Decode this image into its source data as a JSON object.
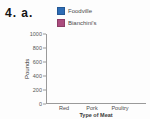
{
  "page": {
    "question_label": "4. a."
  },
  "chart_data": {
    "type": "bar",
    "title": "",
    "xlabel": "Type of Meat",
    "ylabel": "Pounds",
    "categories": [
      "Red",
      "Pork",
      "Poultry"
    ],
    "series": [
      {
        "name": "Bianchini's",
        "color": "#ab4c7e",
        "values": [
          750,
          500,
          750
        ]
      },
      {
        "name": "Foodville",
        "color": "#2d6cb5",
        "values": [
          1000,
          400,
          610
        ]
      }
    ],
    "legend": [
      {
        "label": "Foodville",
        "color": "#2d6cb5"
      },
      {
        "label": "Bianchini's",
        "color": "#ab4c7e"
      }
    ],
    "ylim": [
      0,
      1000
    ],
    "yticks": [
      0,
      200,
      400,
      600,
      800,
      1000
    ],
    "grid": false,
    "legend_position": "top",
    "colors": {
      "axis": "#9a9a9a",
      "text": "#4a4a4a"
    }
  }
}
